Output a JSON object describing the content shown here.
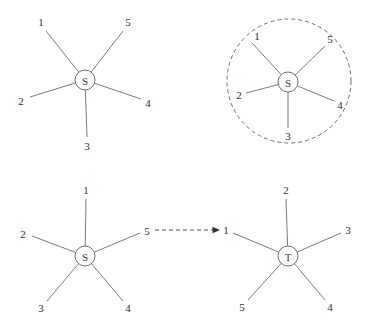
{
  "figure": {
    "title": "",
    "background_color": "#ffffff",
    "edge_color": "#7c7c7c",
    "node_stroke_color": "#6e6e6e",
    "label_color": "#2e2e2e",
    "arrow_color": "#333333",
    "boundary_style": "dashed"
  },
  "panels": [
    {
      "id": "top-left",
      "name": "star-graph-plain",
      "center": {
        "label": "S",
        "x": 85,
        "y": 80,
        "r": 10
      },
      "has_boundary_circle": false,
      "leaves": [
        {
          "label": "1",
          "lx": 41,
          "ly": 22,
          "ex": 46,
          "ey": 31,
          "angle_deg": 143
        },
        {
          "label": "2",
          "lx": 21,
          "ly": 101,
          "ex": 30,
          "ey": 97,
          "angle_deg": 206
        },
        {
          "label": "3",
          "lx": 87,
          "ly": 146,
          "ex": 87,
          "ey": 137,
          "angle_deg": 272
        },
        {
          "label": "4",
          "lx": 148,
          "ly": 103,
          "ex": 141,
          "ey": 99,
          "angle_deg": 335
        },
        {
          "label": "5",
          "lx": 128,
          "ly": 22,
          "ex": 123,
          "ey": 31,
          "angle_deg": 40
        }
      ]
    },
    {
      "id": "top-right",
      "name": "star-graph-bounded",
      "center": {
        "label": "S",
        "x": 288,
        "y": 82,
        "r": 10
      },
      "has_boundary_circle": true,
      "boundary": {
        "cx": 289,
        "cy": 81,
        "r": 62
      },
      "leaves": [
        {
          "label": "1",
          "lx": 257,
          "ly": 36,
          "ex": 252,
          "ey": 43,
          "angle_deg": 130
        },
        {
          "label": "2",
          "lx": 239,
          "ly": 95,
          "ex": 246,
          "ey": 93,
          "angle_deg": 203
        },
        {
          "label": "3",
          "lx": 288,
          "ly": 136,
          "ex": 288,
          "ey": 128,
          "angle_deg": 271
        },
        {
          "label": "4",
          "lx": 340,
          "ly": 105,
          "ex": 334,
          "ey": 101,
          "angle_deg": 333
        },
        {
          "label": "5",
          "lx": 330,
          "ly": 39,
          "ex": 325,
          "ey": 46,
          "angle_deg": 45
        }
      ]
    },
    {
      "id": "bottom-left",
      "name": "star-graph-source",
      "center": {
        "label": "S",
        "x": 85,
        "y": 256,
        "r": 10
      },
      "has_boundary_circle": false,
      "leaves": [
        {
          "label": "1",
          "lx": 86,
          "ly": 190,
          "ex": 86,
          "ey": 199,
          "angle_deg": 91
        },
        {
          "label": "2",
          "lx": 23,
          "ly": 234,
          "ex": 32,
          "ey": 236,
          "angle_deg": 158
        },
        {
          "label": "3",
          "lx": 41,
          "ly": 308,
          "ex": 47,
          "ey": 301,
          "angle_deg": 226
        },
        {
          "label": "4",
          "lx": 128,
          "ly": 308,
          "ex": 123,
          "ey": 301,
          "angle_deg": 315
        },
        {
          "label": "5",
          "lx": 147,
          "ly": 231,
          "ex": 140,
          "ey": 233,
          "angle_deg": 22
        }
      ]
    },
    {
      "id": "bottom-right",
      "name": "star-graph-target",
      "center": {
        "label": "T",
        "x": 288,
        "y": 256,
        "r": 10
      },
      "has_boundary_circle": false,
      "leaves": [
        {
          "label": "2",
          "lx": 286,
          "ly": 190,
          "ex": 286,
          "ey": 199,
          "angle_deg": 91
        },
        {
          "label": "3",
          "lx": 348,
          "ly": 230,
          "ex": 341,
          "ey": 233,
          "angle_deg": 24
        },
        {
          "label": "4",
          "lx": 330,
          "ly": 307,
          "ex": 325,
          "ey": 300,
          "angle_deg": 316
        },
        {
          "label": "5",
          "lx": 242,
          "ly": 307,
          "ex": 248,
          "ey": 300,
          "angle_deg": 226
        },
        {
          "label": "1",
          "lx": 226,
          "ly": 230,
          "ex": 233,
          "ey": 233,
          "angle_deg": 157
        }
      ]
    }
  ],
  "mapping_arrow": {
    "name": "mapping-arrow",
    "from_label": "5",
    "to_label": "1",
    "x1": 155,
    "y1": 230,
    "x2": 220,
    "y2": 230,
    "style": "dashed",
    "head": "filled-triangle"
  }
}
